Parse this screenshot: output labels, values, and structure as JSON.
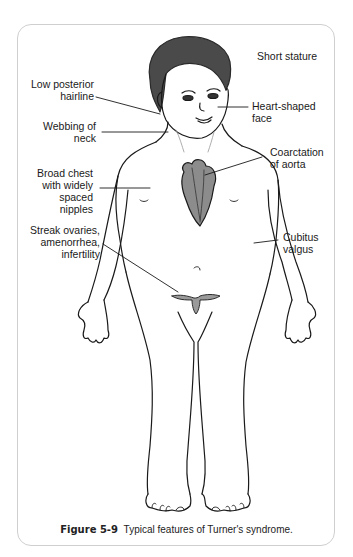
{
  "figure": {
    "number": "Figure 5-9",
    "caption": "Typical features of Turner's syndrome."
  },
  "labels": [
    {
      "id": "short-stature",
      "text": "Short stature",
      "side": "right"
    },
    {
      "id": "low-posterior-hairline",
      "text": "Low posterior\nhairline",
      "side": "left"
    },
    {
      "id": "heart-shaped-face",
      "text": "Heart-shaped\nface",
      "side": "right"
    },
    {
      "id": "webbing-of-neck",
      "text": "Webbing of\nneck",
      "side": "left"
    },
    {
      "id": "coarctation-of-aorta",
      "text": "Coarctation\nof aorta",
      "side": "right"
    },
    {
      "id": "broad-chest",
      "text": "Broad chest\nwith widely\nspaced\nnipples",
      "side": "left"
    },
    {
      "id": "streak-ovaries",
      "text": "Streak ovaries,\namenorrhea,\ninfertility",
      "side": "left"
    },
    {
      "id": "cubitus-valgus",
      "text": "Cubitus\nvalgus",
      "side": "right"
    }
  ],
  "colors": {
    "line": "#1a1a1a",
    "hair": "#4a4a4a",
    "heart": "#8c8c8c",
    "frame_border": "#cfcfcf",
    "organ": "#9a9a9a"
  }
}
